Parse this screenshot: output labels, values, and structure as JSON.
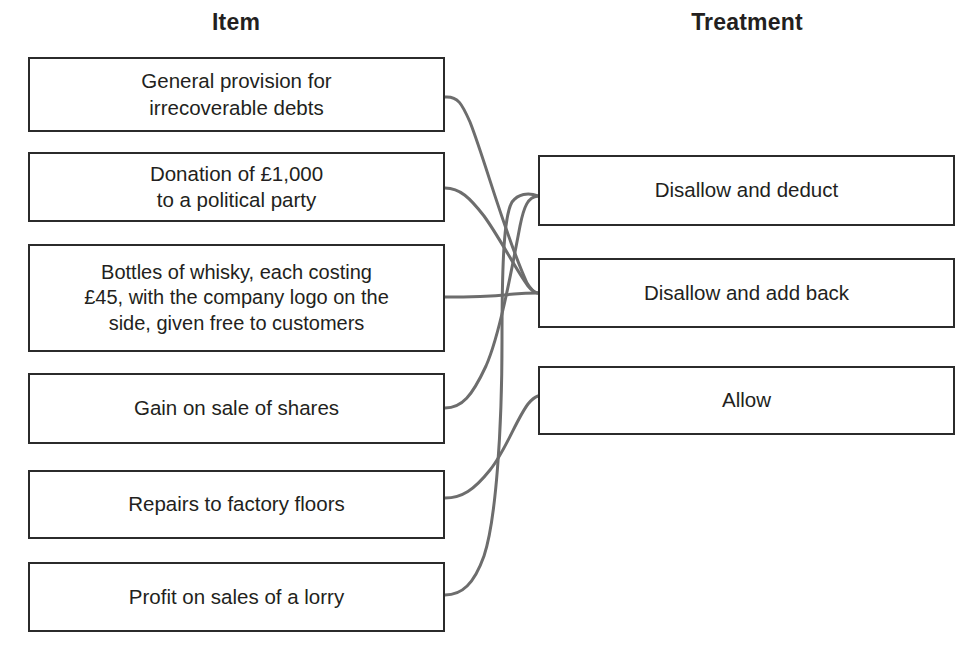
{
  "headings": {
    "left": "Item",
    "right": "Treatment"
  },
  "items": [
    {
      "id": "item-0",
      "lines": [
        "General provision for",
        "irrecoverable debts"
      ]
    },
    {
      "id": "item-1",
      "lines": [
        "Donation of £1,000",
        "to a political party"
      ]
    },
    {
      "id": "item-2",
      "lines": [
        "Bottles of whisky, each costing",
        "£45, with the company logo on the",
        "side, given free to customers"
      ]
    },
    {
      "id": "item-3",
      "lines": [
        "Gain on sale of shares"
      ]
    },
    {
      "id": "item-4",
      "lines": [
        "Repairs to factory floors"
      ]
    },
    {
      "id": "item-5",
      "lines": [
        "Profit on sales of a lorry"
      ]
    }
  ],
  "treatments": [
    {
      "id": "treat-0",
      "label": "Disallow and deduct"
    },
    {
      "id": "treat-1",
      "label": "Disallow and add back"
    },
    {
      "id": "treat-2",
      "label": "Allow"
    }
  ],
  "connections": [
    {
      "from": "item-0",
      "to": "treat-1"
    },
    {
      "from": "item-1",
      "to": "treat-1"
    },
    {
      "from": "item-2",
      "to": "treat-1"
    },
    {
      "from": "item-3",
      "to": "treat-0"
    },
    {
      "from": "item-4",
      "to": "treat-1"
    },
    {
      "from": "item-5",
      "to": "treat-0"
    }
  ],
  "colors": {
    "box_border": "#2b2b2b",
    "connector": "#6d6d6d",
    "text": "#231f20",
    "background": "#ffffff"
  }
}
